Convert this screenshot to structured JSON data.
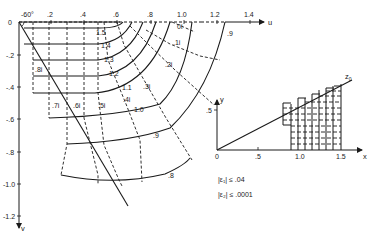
{
  "main_plot": {
    "u_axis": {
      "label": "u",
      "ticks": [
        {
          "value": 0.2,
          "label": ".2"
        },
        {
          "value": 0.4,
          "label": ".4"
        },
        {
          "value": 0.6,
          "label": ".6"
        },
        {
          "value": 0.8,
          "label": ".8"
        },
        {
          "value": 1.0,
          "label": "1.0"
        },
        {
          "value": 1.2,
          "label": "1.2"
        },
        {
          "value": 1.4,
          "label": "1.4"
        }
      ]
    },
    "v_axis": {
      "label": "v",
      "ticks": [
        {
          "value": 0,
          "label": "0"
        },
        {
          "value": -0.2,
          "label": "-.2"
        },
        {
          "value": -0.4,
          "label": "-.4"
        },
        {
          "value": -0.6,
          "label": "-.6"
        },
        {
          "value": -0.8,
          "label": "-.8"
        },
        {
          "value": -1.0,
          "label": "-1.0"
        },
        {
          "value": -1.2,
          "label": "-1.2"
        }
      ]
    },
    "angle_label": "-60°",
    "real_curve_labels": [
      "1.5",
      "1.4",
      "1.3",
      "1.2",
      "1.1",
      "1.0",
      ".9",
      ".8"
    ],
    "imag_curve_labels": [
      "0i",
      ".1i",
      ".2i",
      ".3i",
      ".4i",
      ".5i",
      ".6i",
      ".7i",
      ".8i"
    ],
    "outer_label_9": ".9"
  },
  "inset": {
    "x_axis": {
      "label": "x",
      "ticks": [
        {
          "value": 0,
          "label": "0"
        },
        {
          "value": 0.5,
          "label": ".5"
        },
        {
          "value": 1.0,
          "label": "1.0"
        },
        {
          "value": 1.5,
          "label": "1.5"
        }
      ]
    },
    "y_axis": {
      "label": "y",
      "ticks": [
        {
          "value": 0.5,
          "label": ".5"
        }
      ]
    },
    "line_label": "z0",
    "line_label_main": "z",
    "line_label_sub": "0"
  },
  "error_bounds": {
    "eps1": "|ε₁| ≤ .04",
    "eps2": "|ε₂| ≤ .0001"
  }
}
